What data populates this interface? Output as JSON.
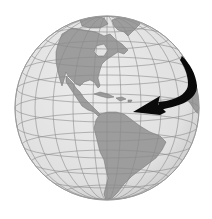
{
  "figure": {
    "description": "Grayscale orthographic globe showing North America, Central America, the Caribbean and South America, with a black curved arrow sweeping from the northeast Atlantic toward the Caribbean",
    "colors": {
      "background": "#ffffff",
      "ocean": "#e3e3e3",
      "ocean_shade": "#c9c9c9",
      "land": "#9d9d9d",
      "land_edge": "#6f6f6f",
      "graticule": "#8c8c8c",
      "arrow": "#0a0a0a",
      "outline": "#a0a0a0"
    },
    "globe": {
      "cx": 107,
      "cy": 108,
      "r": 92
    },
    "regions": [
      "North America",
      "Greenland",
      "Central America",
      "Caribbean",
      "South America",
      "West Africa (edge)"
    ],
    "arrow": {
      "direction": "northeast-to-west",
      "from": "North Atlantic / Europe",
      "to": "Caribbean"
    }
  }
}
